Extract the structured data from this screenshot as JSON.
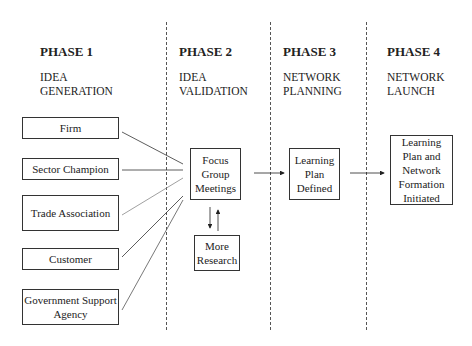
{
  "phases": [
    {
      "title": "PHASE 1",
      "subtitle_1": "IDEA",
      "subtitle_2": "GENERATION"
    },
    {
      "title": "PHASE 2",
      "subtitle_1": "IDEA",
      "subtitle_2": "VALIDATION"
    },
    {
      "title": "PHASE 3",
      "subtitle_1": "NETWORK",
      "subtitle_2": "PLANNING"
    },
    {
      "title": "PHASE 4",
      "subtitle_1": "NETWORK",
      "subtitle_2": "LAUNCH"
    }
  ],
  "sources": [
    {
      "label": "Firm"
    },
    {
      "label": "Sector Champion"
    },
    {
      "label": "Trade Association"
    },
    {
      "label": "Customer"
    },
    {
      "label": "Government Support Agency"
    }
  ],
  "nodes": {
    "focus": "Focus Group Meetings",
    "research": "More Research",
    "plan": "Learning Plan Defined",
    "launch": "Learning Plan and Network Formation Initiated"
  },
  "colors": {
    "line": "#333333",
    "dash": "#555555"
  }
}
